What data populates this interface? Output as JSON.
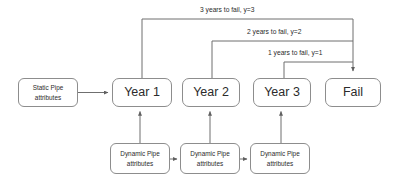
{
  "diagram": {
    "colors": {
      "border": "#8d8d8d",
      "line": "#6f6f6f",
      "text": "#2b2b2b",
      "background": "#ffffff"
    },
    "nodes": {
      "static_pipe": {
        "line1": "Static Pipe",
        "line2": "attributes"
      },
      "year1": {
        "label": "Year 1"
      },
      "year2": {
        "label": "Year 2"
      },
      "year3": {
        "label": "Year 3"
      },
      "fail": {
        "label": "Fail"
      },
      "dynamic1": {
        "line1": "Dynamic Pipe",
        "line2": "attributes"
      },
      "dynamic2": {
        "line1": "Dynamic Pipe",
        "line2": "attributes"
      },
      "dynamic3": {
        "line1": "Dynamic Pipe",
        "line2": "attributes"
      }
    },
    "edge_labels": {
      "y3": "3 years to fail, y=3",
      "y2": "2 years to fail, y=2",
      "y1": "1 years to fail, y=1"
    }
  }
}
